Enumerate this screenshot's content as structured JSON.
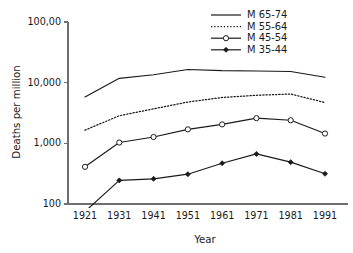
{
  "chart_data": {
    "type": "line",
    "title": "",
    "xlabel": "Year",
    "ylabel": "Deaths per million",
    "x": [
      1921,
      1931,
      1941,
      1951,
      1961,
      1971,
      1981,
      1991
    ],
    "xtick_labels": [
      "1921",
      "1931",
      "1941",
      "1951",
      "1961",
      "1971",
      "1981",
      "1991"
    ],
    "yscale": "log",
    "ylim": [
      100,
      100000
    ],
    "ytick_values": [
      100,
      1000,
      10000,
      100000
    ],
    "ytick_labels": [
      "100",
      "1,000",
      "10,000",
      "100,00"
    ],
    "grid": false,
    "legend_position": "top-right",
    "series": [
      {
        "name": "M 65-74",
        "style": "solid",
        "marker": "none",
        "values": [
          5800,
          11800,
          13500,
          16500,
          15800,
          15600,
          15300,
          12300
        ]
      },
      {
        "name": "M 55-64",
        "style": "dotted",
        "marker": "none",
        "values": [
          1650,
          2850,
          3700,
          4800,
          5700,
          6200,
          6500,
          4700
        ]
      },
      {
        "name": "M 45-54",
        "style": "solid",
        "marker": "open-circle",
        "values": [
          410,
          1030,
          1270,
          1700,
          2050,
          2600,
          2400,
          1450
        ]
      },
      {
        "name": "M 35-44",
        "style": "solid",
        "marker": "filled-diamond",
        "values": [
          75,
          245,
          260,
          310,
          470,
          670,
          490,
          315
        ]
      }
    ]
  },
  "legend": {
    "entries": [
      {
        "label": "M 65-74"
      },
      {
        "label": "M 55-64"
      },
      {
        "label": "M 45-54"
      },
      {
        "label": "M 35-44"
      }
    ]
  },
  "colors": {
    "ink": "#1a1a1a",
    "axis": "#6e6e6e",
    "background": "#ffffff"
  }
}
